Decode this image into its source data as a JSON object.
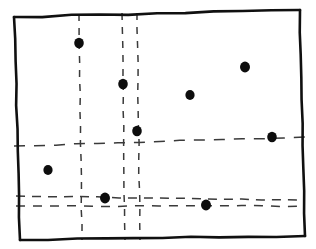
{
  "figure": {
    "kind": "hand-drawn-scatter-with-dashed-gridlines",
    "width": 316,
    "height": 249,
    "background_color": "#ffffff",
    "frame_color": "#101010",
    "dash_color": "#3a3a3a",
    "dot_color": "#0d0d0d",
    "title": "",
    "subtitle": "",
    "caption": ""
  },
  "frame": {
    "name": "plot-border",
    "style": "hand-drawn-quadrilateral",
    "path": "M 14 17 L 300 10 L 305 236 L 20 240 Z",
    "corners": [
      {
        "x": 14,
        "y": 17
      },
      {
        "x": 300,
        "y": 10
      },
      {
        "x": 305,
        "y": 236
      },
      {
        "x": 20,
        "y": 240
      }
    ]
  },
  "chart_data": {
    "type": "scatter",
    "title": "",
    "xlabel": "",
    "ylabel": "",
    "xlim": [
      0,
      316
    ],
    "ylim": [
      249,
      0
    ],
    "grid": true,
    "legend": null,
    "grid_style": "dashed",
    "points": [
      {
        "id": "p1",
        "x": 79,
        "y": 43,
        "r": 5.2
      },
      {
        "id": "p2",
        "x": 123,
        "y": 84,
        "r": 5.2
      },
      {
        "id": "p3",
        "x": 190,
        "y": 95,
        "r": 5.0
      },
      {
        "id": "p4",
        "x": 245,
        "y": 67,
        "r": 5.4
      },
      {
        "id": "p5",
        "x": 137,
        "y": 131,
        "r": 5.2
      },
      {
        "id": "p6",
        "x": 272,
        "y": 137,
        "r": 5.2
      },
      {
        "id": "p7",
        "x": 48,
        "y": 170,
        "r": 5.0
      },
      {
        "id": "p8",
        "x": 105,
        "y": 198,
        "r": 5.4
      },
      {
        "id": "p9",
        "x": 206,
        "y": 205,
        "r": 5.4
      }
    ],
    "vertical_gridlines": [
      {
        "id": "v1",
        "x_top": 79,
        "y_top": 14,
        "x_bottom": 82,
        "y_bottom": 240,
        "dash": "7 7"
      },
      {
        "id": "v2",
        "x_top": 122,
        "y_top": 13,
        "x_bottom": 125,
        "y_bottom": 240,
        "dash": "7 7"
      },
      {
        "id": "v3",
        "x_top": 137,
        "y_top": 13,
        "x_bottom": 140,
        "y_bottom": 240,
        "dash": "7 7"
      }
    ],
    "horizontal_gridlines": [
      {
        "id": "h1",
        "x_left": 14,
        "y_left": 146,
        "x_right": 305,
        "y_right": 137,
        "dash": "11 9"
      },
      {
        "id": "h2",
        "x_left": 16,
        "y_left": 196,
        "x_right": 303,
        "y_right": 200,
        "dash": "9 7"
      },
      {
        "id": "h3",
        "x_left": 16,
        "y_left": 206,
        "x_right": 303,
        "y_right": 206,
        "dash": "9 8"
      }
    ]
  }
}
